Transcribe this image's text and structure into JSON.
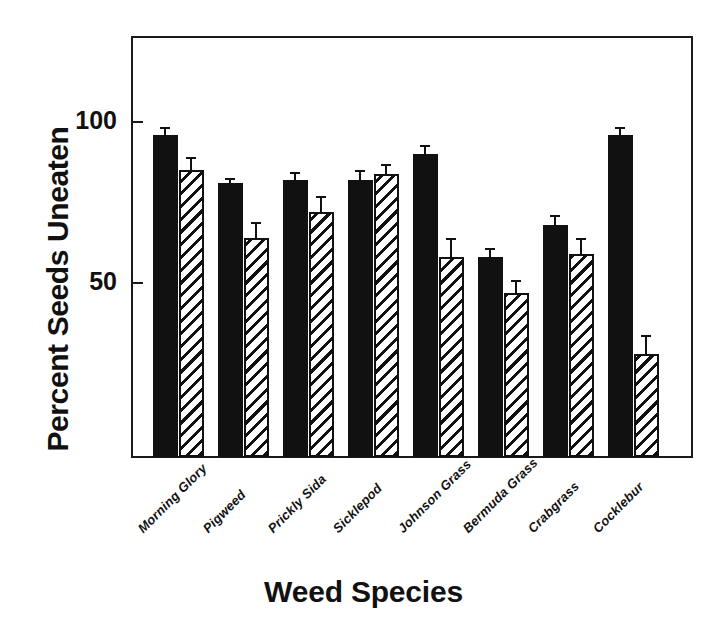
{
  "chart_data": {
    "type": "bar",
    "title": "",
    "xlabel": "Weed Species",
    "ylabel": "Percent Seeds Uneaten",
    "ylim": [
      -4,
      128
    ],
    "yticks": [
      50,
      100
    ],
    "ytick_labels": [
      "50",
      "100"
    ],
    "grid": false,
    "legend": "none",
    "categories": [
      "Morning Glory",
      "Pigweed",
      "Prickly Sida",
      "Sicklepod",
      "Johnson Grass",
      "Bermuda Grass",
      "Crabgrass",
      "Cocklebur"
    ],
    "series": [
      {
        "name": "solid",
        "style": "solid-black",
        "values": [
          96,
          81,
          82,
          82,
          90,
          58,
          68,
          96
        ],
        "errors": [
          2.5,
          1.5,
          2.5,
          3,
          3,
          3,
          3,
          2.5
        ]
      },
      {
        "name": "hatched",
        "style": "diagonal-hatch",
        "values": [
          85,
          64,
          72,
          84,
          58,
          47,
          59,
          28
        ],
        "errors": [
          4,
          5,
          5,
          3,
          6,
          4,
          5,
          6
        ]
      }
    ]
  },
  "axis": {
    "y_title": "Percent Seeds Uneaten",
    "x_title": "Weed Species",
    "y_tick_top_label": "100",
    "y_tick_mid_label": "50"
  },
  "ghost_text": {
    "line1": "the study of seed",
    "line2": "predation rates",
    "line3": "and their effect on",
    "line4": "weed seed banks in",
    "line5": "no-till systems. The",
    "line6": "results indicate that",
    "line7": "seed predators prefer",
    "line8": "certain species."
  }
}
